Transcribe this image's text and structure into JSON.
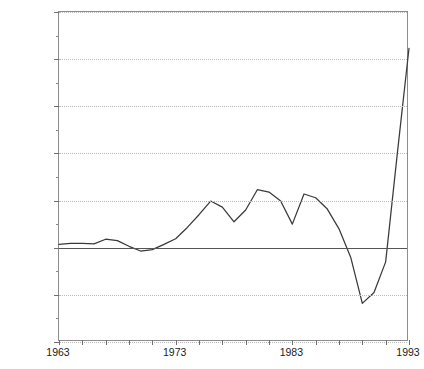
{
  "chart_data": {
    "type": "line",
    "title": "",
    "xlabel": "",
    "ylabel": "",
    "xlim": [
      1963,
      1993
    ],
    "ylim": [
      -20000,
      50000
    ],
    "grid": true,
    "legend": false,
    "y_ticks": [
      50000,
      40000,
      30000,
      20000,
      10000,
      0,
      -10000,
      -20000
    ],
    "y_tick_labels": [
      "50,000",
      "40,000",
      "30,000",
      "20,000",
      "10,000",
      "0",
      "-10,000",
      "-20,000"
    ],
    "y_minor_tick_interval": 5000,
    "x_ticks": [
      1963,
      1965,
      1967,
      1969,
      1971,
      1973,
      1975,
      1977,
      1979,
      1981,
      1983,
      1985,
      1987,
      1989,
      1991,
      1993
    ],
    "x_tick_labels_shown": [
      "1963",
      "1973",
      "1983",
      "1993"
    ],
    "x_labeled_years": [
      1963,
      1973,
      1983,
      1993
    ],
    "x": [
      1963,
      1964,
      1965,
      1966,
      1967,
      1968,
      1969,
      1970,
      1971,
      1972,
      1973,
      1974,
      1975,
      1976,
      1977,
      1978,
      1979,
      1980,
      1981,
      1982,
      1983,
      1984,
      1985,
      1986,
      1987,
      1988,
      1989,
      1990,
      1991,
      1992,
      1993
    ],
    "values": [
      700,
      900,
      900,
      800,
      1800,
      1500,
      300,
      -700,
      -400,
      700,
      1900,
      4300,
      7000,
      9900,
      8600,
      5500,
      8000,
      12300,
      11800,
      9900,
      5000,
      11400,
      10600,
      8200,
      4000,
      -2000,
      -11800,
      -9500,
      -3000,
      20000,
      42300
    ],
    "series": [
      {
        "name": "series-1",
        "color": "#3a3a3a",
        "values": [
          700,
          900,
          900,
          800,
          1800,
          1500,
          300,
          -700,
          -400,
          700,
          1900,
          4300,
          7000,
          9900,
          8600,
          5500,
          8000,
          12300,
          11800,
          9900,
          5000,
          11400,
          10600,
          8200,
          4000,
          -2000,
          -11800,
          -9500,
          -3000,
          20000,
          42300
        ]
      }
    ],
    "annotations": []
  },
  "axes": {
    "y_labels": [
      "50,000",
      "40,000",
      "30,000",
      "20,000",
      "10,000",
      "0",
      "-10,000",
      "-20,000"
    ],
    "x_labels": [
      "1963",
      "1973",
      "1983",
      "1993"
    ]
  },
  "colors": {
    "series_line": "#3a3a3a",
    "gridline": "#c9c9c9",
    "zero_line": "#555555",
    "axis_frame": "#8d8d8d",
    "text": "#1a1a1a",
    "background": "#ffffff"
  }
}
